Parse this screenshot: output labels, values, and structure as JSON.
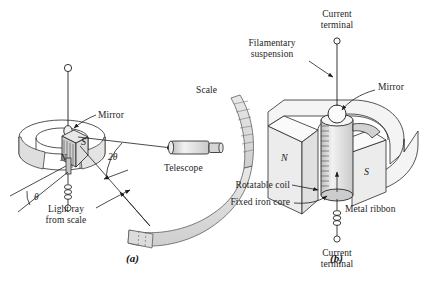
{
  "figure": {
    "background_color": "#ffffff",
    "ink_color": "#1d1d1d",
    "shade_color": "#d9d9d9",
    "panels": [
      {
        "id": "a",
        "id_label": "(a)",
        "caption": "Mirror galvanometer with telescope and scale",
        "labels": {
          "mirror": "Mirror",
          "scale": "Scale",
          "telescope": "Telescope",
          "light_ray": "Light ray\nfrom scale",
          "angle_double": "2θ",
          "angle_single": "θ",
          "pole_n": "N",
          "pole_s": "S"
        }
      },
      {
        "id": "b",
        "id_label": "(b)",
        "caption": "Cutaway of coil between magnet poles",
        "labels": {
          "current_terminal_top": "Current\nterminal",
          "filamentary_suspension": "Filamentary\nsuspension",
          "mirror": "Mirror",
          "pole_n": "N",
          "pole_s": "S",
          "rotatable_coil": "Rotatable coil",
          "fixed_iron_core": "Fixed iron core",
          "metal_ribbon": "Metal ribbon",
          "current_terminal_bottom": "Current\nterminal"
        }
      }
    ]
  }
}
